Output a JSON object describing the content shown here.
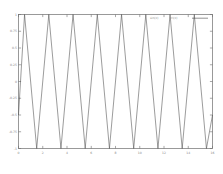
{
  "chart_data": {
    "type": "line",
    "title": "",
    "subtitle": "",
    "xlabel": "",
    "ylabel": "",
    "xlim": [
      0,
      16
    ],
    "ylim": [
      -1,
      1
    ],
    "grid": false,
    "legend_position": "top-right",
    "x_ticks": [
      0,
      2,
      4,
      6,
      8,
      10,
      12,
      14,
      16
    ],
    "x_tick_labels": [
      "0",
      "2",
      "4",
      "6",
      "8",
      "10",
      "12",
      "14",
      "16"
    ],
    "y_ticks": [
      -1,
      -0.75,
      -0.5,
      -0.25,
      0,
      0.25,
      0.5,
      0.75,
      1
    ],
    "y_tick_labels": [
      "-1",
      "-0.75",
      "-0.5",
      "-0.25",
      "0",
      "0.25",
      "0.5",
      "0.75",
      "1"
    ],
    "series": [
      {
        "name": "triangle wave",
        "color": "#4a4a4a",
        "period": 2,
        "amplitude": 1,
        "cycles": 8,
        "waveform": "triangle",
        "x": [
          0,
          0.5,
          1.5,
          2.5,
          3.5,
          4.5,
          5.5,
          6.5,
          7.5,
          8.5,
          9.5,
          10.5,
          11.5,
          12.5,
          13.5,
          14.5,
          15.5,
          16
        ],
        "y": [
          -0.5,
          1,
          -1,
          1,
          -1,
          1,
          -1,
          1,
          -1,
          1,
          -1,
          1,
          -1,
          1,
          -1,
          1,
          -1,
          -0.5
        ]
      }
    ],
    "legend": [
      {
        "label": "wave",
        "color": "#4a4a4a"
      }
    ]
  },
  "legend_text": {
    "entry_left": "sin(x)",
    "entry_right": "tri(x)"
  }
}
